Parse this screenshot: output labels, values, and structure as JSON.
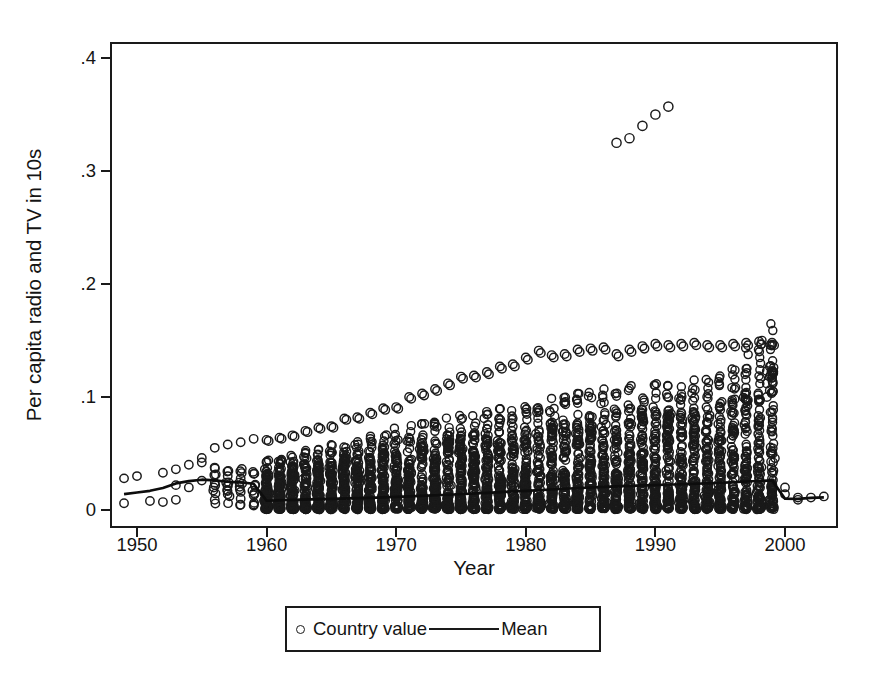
{
  "chart_data": {
    "type": "scatter",
    "title": "",
    "xlabel": "Year",
    "ylabel": "Per capita radio and TV in 10s",
    "xlim": [
      1948,
      2004
    ],
    "ylim": [
      0,
      0.4
    ],
    "grid": false,
    "legend_position": "bottom-center",
    "xticks": [
      "1950",
      "1960",
      "1970",
      "1980",
      "1990",
      "2000"
    ],
    "xtick_values": [
      1950,
      1960,
      1970,
      1980,
      1990,
      2000
    ],
    "yticks": [
      "0",
      ".1",
      ".2",
      ".3",
      ".4"
    ],
    "ytick_values": [
      0,
      0.1,
      0.2,
      0.3,
      0.4
    ],
    "series": [
      {
        "name": "Country value",
        "marker": "open-circle",
        "color": "#1a1a1a",
        "description": "Per-country observations; sparse handful of countries 1949-1959, dense mass of all countries 1960-1999, then only a few countries 2000-2003.",
        "sparse_early_points": [
          [
            1949,
            0.028
          ],
          [
            1949,
            0.006
          ],
          [
            1950,
            0.03
          ],
          [
            1951,
            0.008
          ],
          [
            1952,
            0.033
          ],
          [
            1952,
            0.007
          ],
          [
            1953,
            0.036
          ],
          [
            1953,
            0.022
          ],
          [
            1953,
            0.009
          ],
          [
            1954,
            0.04
          ],
          [
            1954,
            0.02
          ],
          [
            1955,
            0.042
          ],
          [
            1955,
            0.046
          ],
          [
            1955,
            0.026
          ],
          [
            1956,
            0.055
          ],
          [
            1956,
            0.024
          ],
          [
            1956,
            0.009
          ],
          [
            1957,
            0.058
          ],
          [
            1957,
            0.03
          ],
          [
            1957,
            0.021
          ],
          [
            1957,
            0.014
          ],
          [
            1958,
            0.06
          ],
          [
            1958,
            0.028
          ],
          [
            1958,
            0.016
          ],
          [
            1958,
            0.01
          ],
          [
            1959,
            0.063
          ],
          [
            1959,
            0.032
          ],
          [
            1959,
            0.013
          ],
          [
            1959,
            0.004
          ]
        ],
        "upper_envelope_points": [
          [
            1960,
            0.062
          ],
          [
            1961,
            0.064
          ],
          [
            1962,
            0.066
          ],
          [
            1963,
            0.07
          ],
          [
            1964,
            0.073
          ],
          [
            1965,
            0.074
          ],
          [
            1966,
            0.081
          ],
          [
            1967,
            0.082
          ],
          [
            1968,
            0.086
          ],
          [
            1969,
            0.09
          ],
          [
            1970,
            0.091
          ],
          [
            1971,
            0.1
          ],
          [
            1972,
            0.103
          ],
          [
            1973,
            0.107
          ],
          [
            1974,
            0.112
          ],
          [
            1975,
            0.118
          ],
          [
            1976,
            0.119
          ],
          [
            1977,
            0.122
          ],
          [
            1978,
            0.127
          ],
          [
            1979,
            0.129
          ],
          [
            1980,
            0.135
          ],
          [
            1981,
            0.141
          ],
          [
            1982,
            0.137
          ],
          [
            1983,
            0.138
          ],
          [
            1984,
            0.142
          ],
          [
            1985,
            0.143
          ],
          [
            1986,
            0.144
          ],
          [
            1987,
            0.138
          ],
          [
            1988,
            0.142
          ],
          [
            1989,
            0.145
          ],
          [
            1990,
            0.147
          ],
          [
            1991,
            0.146
          ],
          [
            1992,
            0.147
          ],
          [
            1993,
            0.148
          ],
          [
            1994,
            0.146
          ],
          [
            1995,
            0.146
          ],
          [
            1996,
            0.147
          ],
          [
            1997,
            0.148
          ],
          [
            1998,
            0.149
          ],
          [
            1999,
            0.148
          ]
        ],
        "outlier_points": [
          [
            1987,
            0.325
          ],
          [
            1988,
            0.329
          ],
          [
            1989,
            0.34
          ],
          [
            1990,
            0.35
          ],
          [
            1991,
            0.357
          ]
        ],
        "late_sparse_points": [
          [
            2000,
            0.02
          ],
          [
            2000,
            0.014
          ],
          [
            2001,
            0.011
          ],
          [
            2001,
            0.009
          ],
          [
            2002,
            0.011
          ],
          [
            2003,
            0.012
          ]
        ],
        "dense_band_top": [
          [
            1960,
            0.034
          ],
          [
            1965,
            0.044
          ],
          [
            1970,
            0.055
          ],
          [
            1975,
            0.064
          ],
          [
            1980,
            0.072
          ],
          [
            1985,
            0.08
          ],
          [
            1990,
            0.086
          ],
          [
            1995,
            0.091
          ],
          [
            1999,
            0.127
          ]
        ],
        "dense_band_bottom": [
          [
            1960,
            0.0
          ],
          [
            1970,
            0.0
          ],
          [
            1980,
            0.0
          ],
          [
            1990,
            0.0
          ],
          [
            1999,
            0.0
          ]
        ]
      },
      {
        "name": "Mean",
        "marker": "line",
        "color": "#1a1a1a",
        "points": [
          [
            1949,
            0.014
          ],
          [
            1950,
            0.0155
          ],
          [
            1951,
            0.017
          ],
          [
            1952,
            0.0195
          ],
          [
            1953,
            0.0235
          ],
          [
            1954,
            0.0255
          ],
          [
            1955,
            0.0268
          ],
          [
            1956,
            0.0262
          ],
          [
            1957,
            0.025
          ],
          [
            1958,
            0.0245
          ],
          [
            1959,
            0.0232
          ],
          [
            1960,
            0.0082
          ],
          [
            1962,
            0.009
          ],
          [
            1965,
            0.0098
          ],
          [
            1968,
            0.0108
          ],
          [
            1971,
            0.012
          ],
          [
            1974,
            0.0135
          ],
          [
            1977,
            0.0152
          ],
          [
            1980,
            0.017
          ],
          [
            1983,
            0.0188
          ],
          [
            1986,
            0.0205
          ],
          [
            1989,
            0.0218
          ],
          [
            1992,
            0.0228
          ],
          [
            1995,
            0.024
          ],
          [
            1997,
            0.0252
          ],
          [
            1999,
            0.0262
          ],
          [
            2000,
            0.01
          ],
          [
            2001,
            0.0098
          ],
          [
            2002,
            0.0108
          ],
          [
            2003,
            0.0112
          ]
        ]
      }
    ]
  },
  "legend": {
    "country_label": "Country value",
    "mean_label": "Mean"
  }
}
